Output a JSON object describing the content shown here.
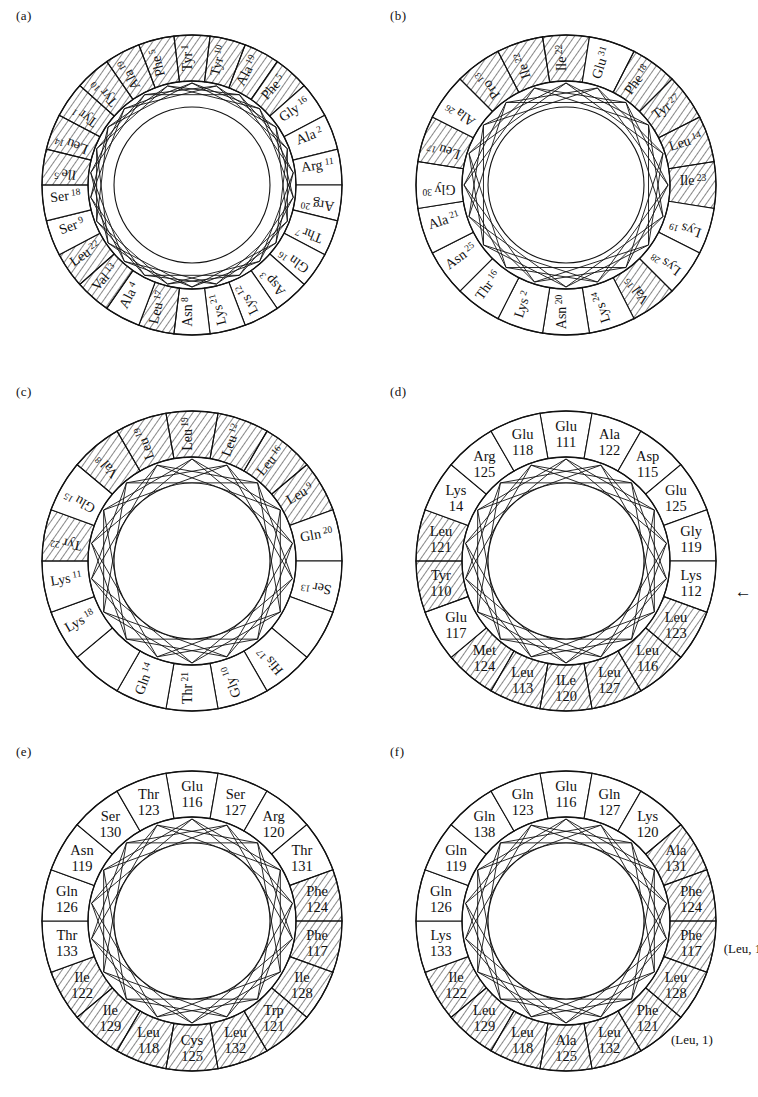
{
  "figure": {
    "panels": [
      {
        "id": "a",
        "label": "(a)",
        "style": "single-line",
        "residue_count": 26,
        "residues": [
          {
            "name": "Tyr",
            "num": "1",
            "hydrophobic": true
          },
          {
            "name": "Tyr",
            "num": "10",
            "hydrophobic": true
          },
          {
            "name": "Ala",
            "num": "19",
            "hydrophobic": true
          },
          {
            "name": "Phe",
            "num": "5",
            "hydrophobic": true
          },
          {
            "name": "Gly",
            "num": "16",
            "hydrophobic": false
          },
          {
            "name": "Ala",
            "num": "2",
            "hydrophobic": false
          },
          {
            "name": "Arg",
            "num": "11",
            "hydrophobic": false
          },
          {
            "name": "Arg",
            "num": "20",
            "hydrophobic": false
          },
          {
            "name": "Thr",
            "num": "7",
            "hydrophobic": false
          },
          {
            "name": "Gln",
            "num": "16",
            "hydrophobic": false
          },
          {
            "name": "Asp",
            "num": "3",
            "hydrophobic": false
          },
          {
            "name": "Lys",
            "num": "12",
            "hydrophobic": false
          },
          {
            "name": "Lys",
            "num": "21",
            "hydrophobic": false
          },
          {
            "name": "Asn",
            "num": "8",
            "hydrophobic": false
          },
          {
            "name": "Leu",
            "num": "17",
            "hydrophobic": true
          },
          {
            "name": "Ala",
            "num": "4",
            "hydrophobic": false
          },
          {
            "name": "Val",
            "num": "13",
            "hydrophobic": true
          },
          {
            "name": "Leu",
            "num": "22",
            "hydrophobic": true
          },
          {
            "name": "Ser",
            "num": "9",
            "hydrophobic": false
          },
          {
            "name": "Ser",
            "num": "18",
            "hydrophobic": false
          },
          {
            "name": "Ile",
            "num": "5",
            "hydrophobic": true
          },
          {
            "name": "Leu",
            "num": "14",
            "hydrophobic": true
          }
        ]
      },
      {
        "id": "b",
        "label": "(b)",
        "style": "single-line",
        "residue_count": 20,
        "residues": [
          {
            "name": "Ile",
            "num": "22",
            "hydrophobic": true
          },
          {
            "name": "Glu",
            "num": "31",
            "hydrophobic": false
          },
          {
            "name": "Phe",
            "num": "18",
            "hydrophobic": true
          },
          {
            "name": "Tyr",
            "num": "27",
            "hydrophobic": true
          },
          {
            "name": "Leu",
            "num": "14",
            "hydrophobic": true
          },
          {
            "name": "Ile",
            "num": "23",
            "hydrophobic": true
          },
          {
            "name": "Lys",
            "num": "19",
            "hydrophobic": false
          },
          {
            "name": "Lys",
            "num": "28",
            "hydrophobic": false
          },
          {
            "name": "Val",
            "num": "15",
            "hydrophobic": true
          },
          {
            "name": "Lys",
            "num": "24",
            "hydrophobic": false
          },
          {
            "name": "Asn",
            "num": "20",
            "hydrophobic": false
          },
          {
            "name": "Lys",
            "num": "2",
            "hydrophobic": false
          },
          {
            "name": "Thr",
            "num": "16",
            "hydrophobic": false
          },
          {
            "name": "Asn",
            "num": "25",
            "hydrophobic": false
          },
          {
            "name": "Ala",
            "num": "21",
            "hydrophobic": false
          },
          {
            "name": "Gly",
            "num": "30",
            "hydrophobic": false
          },
          {
            "name": "Leu",
            "num": "17",
            "hydrophobic": true
          },
          {
            "name": "Ala",
            "num": "26",
            "hydrophobic": false
          },
          {
            "name": "Pro",
            "num": "13",
            "hydrophobic": true
          }
        ]
      },
      {
        "id": "c",
        "label": "(c)",
        "style": "single-line",
        "residue_count": 18,
        "residues": [
          {
            "name": "Leu",
            "num": "19",
            "hydrophobic": true
          },
          {
            "name": "Leu",
            "num": "12",
            "hydrophobic": true
          },
          {
            "name": "Leu",
            "num": "16",
            "hydrophobic": true
          },
          {
            "name": "Leu",
            "num": "9",
            "hydrophobic": true
          },
          {
            "name": "Gln",
            "num": "20",
            "hydrophobic": false
          },
          {
            "name": "Ser",
            "num": "13",
            "hydrophobic": false
          },
          {
            "name": "",
            "num": "",
            "hydrophobic": false
          },
          {
            "name": "His",
            "num": "17",
            "hydrophobic": false
          },
          {
            "name": "Gly",
            "num": "10",
            "hydrophobic": false
          },
          {
            "name": "Thr",
            "num": "21",
            "hydrophobic": false
          },
          {
            "name": "Gln",
            "num": "14",
            "hydrophobic": false
          },
          {
            "name": "",
            "num": "",
            "hydrophobic": false
          },
          {
            "name": "Lys",
            "num": "18",
            "hydrophobic": false
          },
          {
            "name": "Lys",
            "num": "11",
            "hydrophobic": false
          },
          {
            "name": "Tyr",
            "num": "22",
            "hydrophobic": true
          },
          {
            "name": "Glu",
            "num": "15",
            "hydrophobic": false
          },
          {
            "name": "Val",
            "num": "8",
            "hydrophobic": true
          }
        ]
      },
      {
        "id": "d",
        "label": "(d)",
        "style": "two-line",
        "residue_count": 18,
        "arrow": "←",
        "arrow_target": "Lys 112",
        "residues": [
          {
            "name": "Glu",
            "num": "111",
            "hydrophobic": false
          },
          {
            "name": "Ala",
            "num": "122",
            "hydrophobic": false
          },
          {
            "name": "Asp",
            "num": "115",
            "hydrophobic": false
          },
          {
            "name": "Glu",
            "num": "125",
            "hydrophobic": false
          },
          {
            "name": "Gly",
            "num": "119",
            "hydrophobic": false
          },
          {
            "name": "Lys",
            "num": "112",
            "hydrophobic": false
          },
          {
            "name": "Leu",
            "num": "123",
            "hydrophobic": true
          },
          {
            "name": "Leu",
            "num": "116",
            "hydrophobic": true
          },
          {
            "name": "Leu",
            "num": "127",
            "hydrophobic": true
          },
          {
            "name": "ILe",
            "num": "120",
            "hydrophobic": true
          },
          {
            "name": "Leu",
            "num": "113",
            "hydrophobic": true
          },
          {
            "name": "Met",
            "num": "124",
            "hydrophobic": true
          },
          {
            "name": "Glu",
            "num": "117",
            "hydrophobic": false
          },
          {
            "name": "Tyr",
            "num": "110",
            "hydrophobic": true
          },
          {
            "name": "Leu",
            "num": "121",
            "hydrophobic": true
          },
          {
            "name": "Lys",
            "num": "14",
            "hydrophobic": false
          },
          {
            "name": "Arg",
            "num": "125",
            "hydrophobic": false
          },
          {
            "name": "Glu",
            "num": "118",
            "hydrophobic": false
          }
        ]
      },
      {
        "id": "e",
        "label": "(e)",
        "style": "two-line",
        "residue_count": 18,
        "residues": [
          {
            "name": "Glu",
            "num": "116",
            "hydrophobic": false
          },
          {
            "name": "Ser",
            "num": "127",
            "hydrophobic": false
          },
          {
            "name": "Arg",
            "num": "120",
            "hydrophobic": false
          },
          {
            "name": "Thr",
            "num": "131",
            "hydrophobic": false
          },
          {
            "name": "Phe",
            "num": "124",
            "hydrophobic": true
          },
          {
            "name": "Phe",
            "num": "117",
            "hydrophobic": true
          },
          {
            "name": "Ile",
            "num": "128",
            "hydrophobic": true
          },
          {
            "name": "Trp",
            "num": "121",
            "hydrophobic": true
          },
          {
            "name": "Leu",
            "num": "132",
            "hydrophobic": true
          },
          {
            "name": "Cys",
            "num": "125",
            "hydrophobic": true
          },
          {
            "name": "Leu",
            "num": "118",
            "hydrophobic": true
          },
          {
            "name": "Ile",
            "num": "129",
            "hydrophobic": true
          },
          {
            "name": "Ile",
            "num": "122",
            "hydrophobic": true
          },
          {
            "name": "Thr",
            "num": "133",
            "hydrophobic": false
          },
          {
            "name": "Gln",
            "num": "126",
            "hydrophobic": false
          },
          {
            "name": "Asn",
            "num": "119",
            "hydrophobic": false
          },
          {
            "name": "Ser",
            "num": "130",
            "hydrophobic": false
          },
          {
            "name": "Thr",
            "num": "123",
            "hydrophobic": false
          }
        ]
      },
      {
        "id": "f",
        "label": "(f)",
        "style": "two-line",
        "residue_count": 18,
        "residues": [
          {
            "name": "Glu",
            "num": "116",
            "hydrophobic": false
          },
          {
            "name": "Gln",
            "num": "127",
            "hydrophobic": false
          },
          {
            "name": "Lys",
            "num": "120",
            "hydrophobic": false
          },
          {
            "name": "Ala",
            "num": "131",
            "hydrophobic": true
          },
          {
            "name": "Phe",
            "num": "124",
            "hydrophobic": true
          },
          {
            "name": "Phe",
            "num": "117",
            "hydrophobic": true,
            "annotation": "(Leu, 1)"
          },
          {
            "name": "Leu",
            "num": "128",
            "hydrophobic": true
          },
          {
            "name": "Phe",
            "num": "121",
            "hydrophobic": true,
            "annotation": "(Leu, 1)"
          },
          {
            "name": "Leu",
            "num": "132",
            "hydrophobic": true
          },
          {
            "name": "Ala",
            "num": "125",
            "hydrophobic": true
          },
          {
            "name": "Leu",
            "num": "118",
            "hydrophobic": true
          },
          {
            "name": "Leu",
            "num": "129",
            "hydrophobic": true
          },
          {
            "name": "Ile",
            "num": "122",
            "hydrophobic": true
          },
          {
            "name": "Lys",
            "num": "133",
            "hydrophobic": false
          },
          {
            "name": "Gln",
            "num": "126",
            "hydrophobic": false
          },
          {
            "name": "Gln",
            "num": "119",
            "hydrophobic": false
          },
          {
            "name": "Gln",
            "num": "138",
            "hydrophobic": false
          },
          {
            "name": "Gln",
            "num": "123",
            "hydrophobic": false
          }
        ]
      }
    ]
  },
  "colors": {
    "ink": "#111111",
    "background": "#ffffff"
  }
}
